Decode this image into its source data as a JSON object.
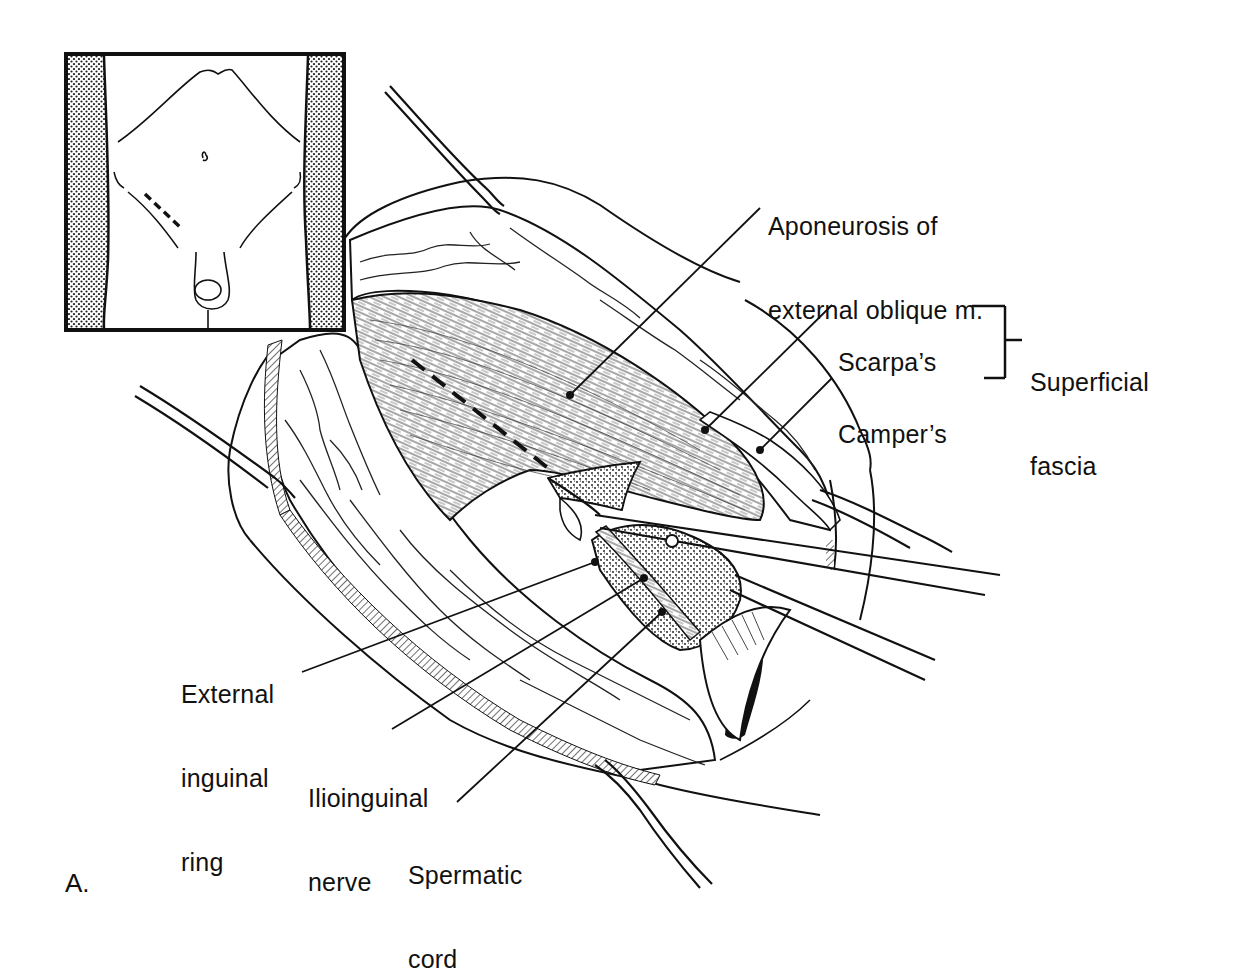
{
  "figure": {
    "panel_letter": "A.",
    "colors": {
      "ink": "#111111",
      "paper": "#ffffff",
      "stipple": "#555555"
    }
  },
  "inset": {
    "description": "Anterior torso outline with dashed incision line in right lower quadrant"
  },
  "labels": {
    "aponeurosis": {
      "line1": "Aponeurosis of",
      "line2": "external oblique m."
    },
    "scarpa": {
      "text": "Scarpa’s"
    },
    "camper": {
      "text": "Camper’s"
    },
    "superficial_fascia": {
      "line1": "Superficial",
      "line2": "fascia"
    },
    "external_ring": {
      "line1": "External",
      "line2": "inguinal",
      "line3": "ring"
    },
    "ilioinguinal": {
      "line1": "Ilioinguinal",
      "line2": "nerve"
    },
    "spermatic": {
      "line1": "Spermatic",
      "line2": "cord"
    }
  }
}
